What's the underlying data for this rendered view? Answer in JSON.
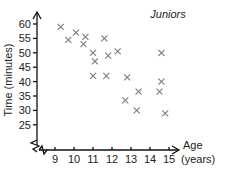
{
  "chart_data": {
    "type": "scatter",
    "title": "Juniors",
    "xlabel": "Age (years)",
    "xlabel_lines": [
      "Age",
      "(years)"
    ],
    "ylabel": "Time (minutes)",
    "xlim": [
      8.2,
      15.6
    ],
    "ylim": [
      21,
      62
    ],
    "x_ticks": [
      9,
      10,
      11,
      12,
      13,
      14,
      15
    ],
    "y_ticks": [
      25,
      30,
      35,
      40,
      45,
      50,
      55,
      60
    ],
    "axis_break": true,
    "grid": false,
    "legend": null,
    "marker": "x",
    "marker_color": "#7a7a7a",
    "points": [
      {
        "x": 9.3,
        "y": 59
      },
      {
        "x": 9.7,
        "y": 54.5
      },
      {
        "x": 10.1,
        "y": 57
      },
      {
        "x": 10.5,
        "y": 53
      },
      {
        "x": 10.6,
        "y": 55.5
      },
      {
        "x": 11.0,
        "y": 50
      },
      {
        "x": 11.1,
        "y": 47
      },
      {
        "x": 11.6,
        "y": 55
      },
      {
        "x": 11.8,
        "y": 49
      },
      {
        "x": 12.3,
        "y": 50.5
      },
      {
        "x": 11.0,
        "y": 42
      },
      {
        "x": 11.7,
        "y": 42
      },
      {
        "x": 12.8,
        "y": 41.5
      },
      {
        "x": 13.4,
        "y": 36.5
      },
      {
        "x": 12.7,
        "y": 33.5
      },
      {
        "x": 13.3,
        "y": 30
      },
      {
        "x": 14.6,
        "y": 50
      },
      {
        "x": 14.6,
        "y": 40
      },
      {
        "x": 14.5,
        "y": 36.5
      },
      {
        "x": 14.8,
        "y": 29
      }
    ]
  }
}
